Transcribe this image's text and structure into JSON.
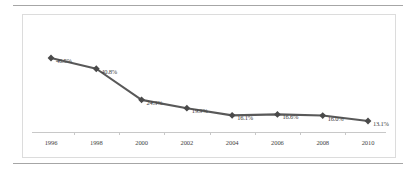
{
  "chart_data": {
    "type": "line",
    "title": "",
    "subtitle": "",
    "xlabel": "",
    "ylabel": "",
    "categories": [
      "1996",
      "1998",
      "2000",
      "2002",
      "2004",
      "2006",
      "2008",
      "2010"
    ],
    "values": [
      46.5,
      40.8,
      24.3,
      19.9,
      16.1,
      16.6,
      16.0,
      13.1
    ],
    "point_labels": [
      "46.5%",
      "40.8%",
      "24.3%",
      "19.9%",
      "16.1%",
      "16.6%",
      "16.0%",
      "13.1%"
    ],
    "series": [
      {
        "name": "",
        "values": [
          46.5,
          40.8,
          24.3,
          19.9,
          16.1,
          16.6,
          16.0,
          13.1
        ]
      }
    ],
    "ylim": [
      0,
      50
    ],
    "xlim": [
      "1996",
      "2010"
    ],
    "grid": false,
    "legend": false,
    "legend_position": "none",
    "marker": "diamond",
    "line_color": "#595959",
    "marker_color": "#4a4a4a",
    "axis_color": "#c8c8c8",
    "label_color": "#3f3f3f",
    "frame_color": "#dcdcdc",
    "rule_color": "#a6a6a6"
  }
}
